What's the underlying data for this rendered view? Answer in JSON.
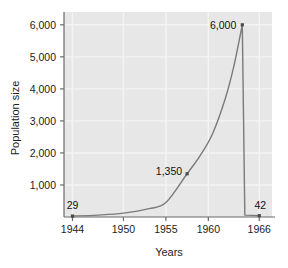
{
  "chart_data": {
    "type": "line",
    "title": "",
    "xlabel": "Years",
    "ylabel": "Population size",
    "xlim": [
      1943,
      1967.5
    ],
    "ylim": [
      0,
      6400
    ],
    "grid": true,
    "legend": "none",
    "x_ticks": [
      "1944",
      "1950",
      "1955",
      "1960",
      "1966"
    ],
    "x_tick_values": [
      1944,
      1950,
      1955,
      1960,
      1966
    ],
    "y_ticks": [
      "1,000",
      "2,000",
      "3,000",
      "4,000",
      "5,000",
      "6,000"
    ],
    "y_tick_values": [
      1000,
      2000,
      3000,
      4000,
      5000,
      6000
    ],
    "series": [
      {
        "name": "Population",
        "x": [
          1944,
          1947,
          1950,
          1953,
          1955,
          1957.5,
          1959,
          1960.5,
          1962,
          1963,
          1964,
          1964.3,
          1966
        ],
        "values": [
          29,
          60,
          120,
          260,
          450,
          1350,
          1900,
          2600,
          3700,
          4700,
          6000,
          60,
          42
        ]
      }
    ],
    "annotations": [
      {
        "label": "29",
        "x": 1944,
        "y": 29,
        "value": 29
      },
      {
        "label": "1,350",
        "x": 1957.5,
        "y": 1350,
        "value": 1350
      },
      {
        "label": "6,000",
        "x": 1964,
        "y": 6000,
        "value": 6000
      },
      {
        "label": "42",
        "x": 1966,
        "y": 42,
        "value": 42
      }
    ],
    "markers": [
      {
        "x": 1944,
        "y": 29
      },
      {
        "x": 1957.5,
        "y": 1350
      },
      {
        "x": 1964,
        "y": 6000
      },
      {
        "x": 1966,
        "y": 42
      }
    ],
    "colors": {
      "plot_background": "#e7e7e7",
      "gridline": "#f4f4f4",
      "axis": "#6b6b6b",
      "line": "#7a7a7a",
      "marker": "#4a4a4a",
      "text": "#1c1c1c",
      "page_background": "#ffffff"
    }
  }
}
